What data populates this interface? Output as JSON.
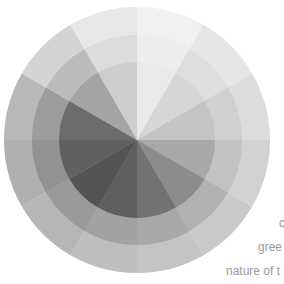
{
  "wheel": {
    "cx": 137,
    "cy": 140,
    "radii": [
      133,
      105,
      78
    ],
    "segments": [
      [
        "#f1f1f1",
        "#ededed",
        "#e9e9e9"
      ],
      [
        "#e6e6e6",
        "#dedede",
        "#d6d6d6"
      ],
      [
        "#dcdcdc",
        "#d0d0d0",
        "#c4c4c4"
      ],
      [
        "#d2d2d2",
        "#c2c2c2",
        "#a8a8a8"
      ],
      [
        "#cacaca",
        "#b2b2b2",
        "#8c8c8c"
      ],
      [
        "#c4c4c4",
        "#a8a8a8",
        "#727272"
      ],
      [
        "#bebebe",
        "#a2a2a2",
        "#5e5e5e"
      ],
      [
        "#b6b6b6",
        "#9a9a9a",
        "#545454"
      ],
      [
        "#b0b0b0",
        "#929292",
        "#606060"
      ],
      [
        "#b8b8b8",
        "#9c9c9c",
        "#6c6c6c"
      ],
      [
        "#d4d4d4",
        "#bcbcbc",
        "#a4a4a4"
      ],
      [
        "#e8e8e8",
        "#dcdcdc",
        "#cecece"
      ]
    ]
  },
  "caption": {
    "lines": [
      "c",
      "gree",
      "nature of t"
    ]
  }
}
